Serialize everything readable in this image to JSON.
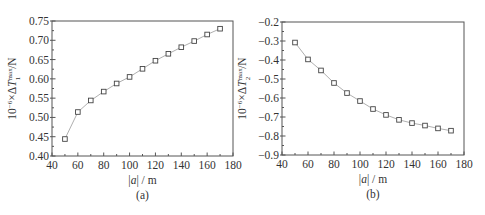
{
  "chart_data": [
    {
      "id": "a",
      "type": "line",
      "caption": "(a)",
      "title": "",
      "xlabel": "|a| / m",
      "ylabel": "10^-6 × ΔT1^max / N",
      "ylabel_parts": {
        "prefix": "10",
        "exp": "−6",
        "mid": "×ΔT",
        "sup": "max",
        "sub": "1",
        "suffix": "/N"
      },
      "xlim": [
        40,
        180
      ],
      "ylim": [
        0.4,
        0.75
      ],
      "xticks": [
        40,
        60,
        80,
        100,
        120,
        140,
        160,
        180
      ],
      "yticks": [
        0.4,
        0.45,
        0.5,
        0.55,
        0.6,
        0.65,
        0.7,
        0.75
      ],
      "ytick_labels": [
        "0.40",
        "0.45",
        "0.50",
        "0.55",
        "0.60",
        "0.65",
        "0.70",
        "0.75"
      ],
      "grid": false,
      "marker": "open-square",
      "series": [
        {
          "name": "ΔT1 max",
          "x": [
            50,
            60,
            70,
            80,
            90,
            100,
            110,
            120,
            130,
            140,
            150,
            160,
            170
          ],
          "values": [
            0.444,
            0.514,
            0.544,
            0.567,
            0.588,
            0.605,
            0.626,
            0.647,
            0.665,
            0.682,
            0.698,
            0.715,
            0.73
          ]
        }
      ]
    },
    {
      "id": "b",
      "type": "line",
      "caption": "(b)",
      "title": "",
      "xlabel": "|a| / m",
      "ylabel": "10^-6 × ΔT2^max / N",
      "ylabel_parts": {
        "prefix": "10",
        "exp": "−6",
        "mid": "×ΔT",
        "sup": "max",
        "sub": "2",
        "suffix": "/N"
      },
      "xlim": [
        40,
        180
      ],
      "ylim": [
        -0.9,
        -0.2
      ],
      "xticks": [
        40,
        60,
        80,
        100,
        120,
        140,
        160,
        180
      ],
      "yticks": [
        -0.9,
        -0.8,
        -0.7,
        -0.6,
        -0.5,
        -0.4,
        -0.3,
        -0.2
      ],
      "ytick_labels": [
        "−0.9",
        "−0.8",
        "−0.7",
        "−0.6",
        "−0.5",
        "−0.4",
        "−0.3",
        "−0.2"
      ],
      "grid": false,
      "marker": "open-square",
      "series": [
        {
          "name": "ΔT2 max",
          "x": [
            50,
            60,
            70,
            80,
            90,
            100,
            110,
            120,
            130,
            140,
            150,
            160,
            170
          ],
          "values": [
            -0.308,
            -0.397,
            -0.455,
            -0.521,
            -0.574,
            -0.616,
            -0.658,
            -0.689,
            -0.715,
            -0.732,
            -0.745,
            -0.76,
            -0.772
          ]
        }
      ]
    }
  ],
  "layout": {
    "panels": [
      {
        "left": 52,
        "top": 21,
        "right": 233,
        "bottom": 156
      },
      {
        "left": 282,
        "top": 22,
        "right": 464,
        "bottom": 155
      }
    ]
  }
}
